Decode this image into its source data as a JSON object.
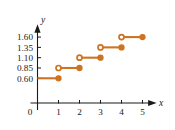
{
  "chart_data": {
    "type": "line",
    "subtype": "step-function",
    "title": "",
    "subtitle": "",
    "xlabel": "x",
    "ylabel": "y",
    "xlim": [
      0,
      5.6
    ],
    "ylim": [
      0,
      1.85
    ],
    "grid": false,
    "legend": null,
    "accent_color": "#CE7322",
    "axis_color": "#1a1a1a",
    "background_color": "#ffffff",
    "x_ticks": [
      {
        "value": 0,
        "label": "0"
      },
      {
        "value": 1,
        "label": "1"
      },
      {
        "value": 2,
        "label": "2"
      },
      {
        "value": 3,
        "label": "3"
      },
      {
        "value": 4,
        "label": "4"
      },
      {
        "value": 5,
        "label": "5"
      }
    ],
    "y_ticks": [
      {
        "value": 0.6,
        "label": "0.60"
      },
      {
        "value": 0.85,
        "label": "0.85"
      },
      {
        "value": 1.1,
        "label": "1.10"
      },
      {
        "value": 1.35,
        "label": "1.35"
      },
      {
        "value": 1.6,
        "label": "1.60"
      }
    ],
    "series": [
      {
        "name": "step",
        "steps": [
          {
            "x_start": 0,
            "x_end": 1,
            "y": 0.6,
            "left_endpoint": "none",
            "right_endpoint": "closed"
          },
          {
            "x_start": 1,
            "x_end": 2,
            "y": 0.85,
            "left_endpoint": "open",
            "right_endpoint": "closed"
          },
          {
            "x_start": 2,
            "x_end": 3,
            "y": 1.1,
            "left_endpoint": "open",
            "right_endpoint": "closed"
          },
          {
            "x_start": 3,
            "x_end": 4,
            "y": 1.35,
            "left_endpoint": "open",
            "right_endpoint": "closed"
          },
          {
            "x_start": 4,
            "x_end": 5,
            "y": 1.6,
            "left_endpoint": "open",
            "right_endpoint": "closed"
          }
        ]
      }
    ]
  }
}
